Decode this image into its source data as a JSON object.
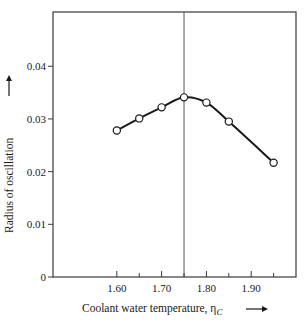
{
  "chart_data": {
    "type": "line",
    "title": "",
    "xlabel": "Coolant water temperature, η",
    "xlabel_subscript": "C",
    "xlabel_arrow": "→",
    "ylabel": "Radius of oscillation",
    "ylabel_arrow": "→",
    "x": [
      1.6,
      1.65,
      1.7,
      1.75,
      1.8,
      1.85,
      1.95
    ],
    "series": [
      {
        "name": "Radius of oscillation",
        "values": [
          0.0278,
          0.0301,
          0.0322,
          0.0341,
          0.0331,
          0.0295,
          0.0217
        ],
        "marker": "open-circle",
        "line": "smooth-solid",
        "color": "#1a1a1a"
      }
    ],
    "xlim": [
      1.4575,
      2.0
    ],
    "ylim": [
      0,
      0.0503
    ],
    "x_ticks_major": [
      1.6,
      1.7,
      1.8,
      1.9
    ],
    "x_tick_labels": [
      "1.60",
      "1.70",
      "1.80",
      "1.90"
    ],
    "x_ticks_minor": [
      1.65,
      1.75,
      1.85,
      1.95
    ],
    "y_ticks": [
      0,
      0.01,
      0.02,
      0.03,
      0.04
    ],
    "y_tick_labels": [
      "0",
      "0.01",
      "0.02",
      "0.03",
      "0.04"
    ],
    "reference_line": {
      "orientation": "vertical",
      "x": 1.75
    },
    "grid": false,
    "legend": "none",
    "frame": "box"
  }
}
